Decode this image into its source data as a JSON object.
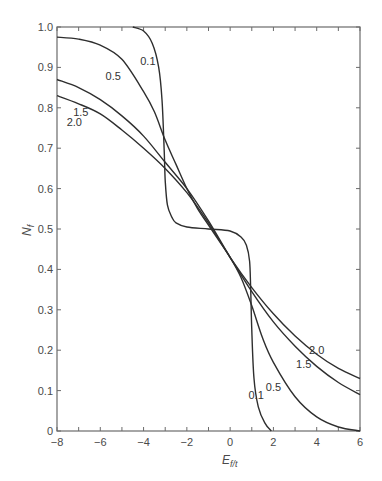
{
  "chart_data": {
    "type": "line",
    "title": "",
    "xlabel": "E",
    "xlabel_subscript": "f/t",
    "ylabel": "N",
    "ylabel_subscript": "f",
    "xlim": [
      -8,
      6
    ],
    "ylim": [
      0,
      1.0
    ],
    "grid": false,
    "legend": "inline curve labels",
    "x_ticks": [
      "-8",
      "-6",
      "-4",
      "-2",
      "0",
      "2",
      "4",
      "6"
    ],
    "y_ticks": [
      "0",
      "0.1",
      "0.2",
      "0.3",
      "0.4",
      "0.5",
      "0.6",
      "0.7",
      "0.8",
      "0.9",
      "1.0"
    ],
    "series": [
      {
        "name": "0.1",
        "x": [
          -4.5,
          -4.0,
          -3.6,
          -3.3,
          -3.15,
          -3.05,
          -3.0,
          -2.9,
          -2.7,
          -2.5,
          -2.0,
          -1.0,
          0.0,
          0.5,
          0.75,
          0.9,
          0.95,
          1.0,
          1.1,
          1.3,
          1.6,
          1.9
        ],
        "y": [
          1.0,
          0.99,
          0.96,
          0.9,
          0.82,
          0.7,
          0.62,
          0.56,
          0.53,
          0.515,
          0.505,
          0.5,
          0.495,
          0.48,
          0.46,
          0.42,
          0.35,
          0.25,
          0.13,
          0.06,
          0.02,
          0.0
        ]
      },
      {
        "name": "0.5",
        "x": [
          -8,
          -7,
          -6,
          -5,
          -4,
          -3.5,
          -3,
          -2.5,
          -2,
          -1.5,
          -1,
          -0.5,
          0,
          0.5,
          1,
          1.5,
          2,
          3,
          4,
          5,
          6
        ],
        "y": [
          0.975,
          0.97,
          0.955,
          0.92,
          0.84,
          0.79,
          0.72,
          0.66,
          0.6,
          0.55,
          0.51,
          0.47,
          0.43,
          0.38,
          0.31,
          0.23,
          0.17,
          0.085,
          0.035,
          0.01,
          0.0
        ]
      },
      {
        "name": "1.5",
        "x": [
          -8,
          -7,
          -6,
          -5,
          -4,
          -3,
          -2,
          -1,
          0,
          1,
          2,
          3,
          4,
          5,
          6
        ],
        "y": [
          0.87,
          0.85,
          0.82,
          0.78,
          0.73,
          0.665,
          0.6,
          0.52,
          0.43,
          0.345,
          0.27,
          0.21,
          0.16,
          0.12,
          0.09
        ]
      },
      {
        "name": "2.0",
        "x": [
          -8,
          -7,
          -6,
          -5,
          -4,
          -3,
          -2,
          -1,
          0,
          1,
          2,
          3,
          4,
          5,
          6
        ],
        "y": [
          0.83,
          0.81,
          0.785,
          0.745,
          0.7,
          0.65,
          0.59,
          0.515,
          0.43,
          0.355,
          0.29,
          0.235,
          0.19,
          0.155,
          0.13
        ]
      }
    ],
    "annotations": [
      {
        "text": "0.1",
        "x": -3.8,
        "y": 0.905
      },
      {
        "text": "0.5",
        "x": -5.4,
        "y": 0.87
      },
      {
        "text": "1.5",
        "x": -6.9,
        "y": 0.78
      },
      {
        "text": "2.0",
        "x": -7.2,
        "y": 0.755
      },
      {
        "text": "0.1",
        "x": 1.2,
        "y": 0.08
      },
      {
        "text": "0.5",
        "x": 2.0,
        "y": 0.1
      },
      {
        "text": "1.5",
        "x": 3.4,
        "y": 0.155
      },
      {
        "text": "2.0",
        "x": 4.0,
        "y": 0.19
      }
    ]
  }
}
